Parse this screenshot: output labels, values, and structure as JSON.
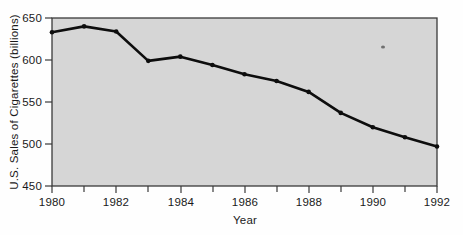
{
  "chart_data": {
    "type": "line",
    "title": "",
    "xlabel": "Year",
    "ylabel": "U.S. Sales of Cigarettes (billions)",
    "x": [
      1980,
      1981,
      1982,
      1983,
      1984,
      1985,
      1986,
      1987,
      1988,
      1989,
      1990,
      1991,
      1992
    ],
    "values": [
      633,
      640,
      634,
      599,
      604,
      594,
      583,
      575,
      562,
      537,
      520,
      508,
      497
    ],
    "series": [
      {
        "name": "U.S. Sales of Cigarettes",
        "values": [
          633,
          640,
          634,
          599,
          604,
          594,
          583,
          575,
          562,
          537,
          520,
          508,
          497
        ]
      }
    ],
    "xlim": [
      1980,
      1992
    ],
    "ylim": [
      450,
      650
    ],
    "xticks": [
      1980,
      1982,
      1984,
      1986,
      1988,
      1990,
      1992
    ],
    "xtick_labels": [
      "1980",
      "1982",
      "1984",
      "1986",
      "1988",
      "1990",
      "1992"
    ],
    "xminor_ticks": [
      1981,
      1983,
      1985,
      1987,
      1989,
      1991
    ],
    "yticks": [
      450,
      500,
      550,
      600,
      650
    ],
    "ytick_labels": [
      "450",
      "500",
      "550",
      "600",
      "650"
    ],
    "grid": false,
    "legend": null,
    "markers": "filled-circle",
    "line_color": "#0d0d0d",
    "plot_background_color": "#d6d6d6",
    "figure_background_color": "#fefefe"
  }
}
